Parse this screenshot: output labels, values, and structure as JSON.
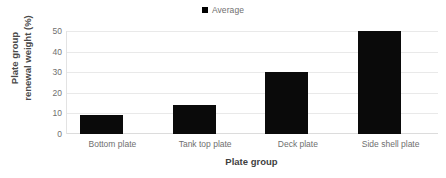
{
  "chart_data": {
    "type": "bar",
    "title": "",
    "subtitle": "",
    "categories": [
      "Bottom plate",
      "Tank top plate",
      "Deck plate",
      "Side shell plate"
    ],
    "values": [
      9,
      14,
      30,
      50
    ],
    "series": [
      {
        "name": "Average",
        "values": [
          9,
          14,
          30,
          50
        ]
      }
    ],
    "xlabel": "Plate group",
    "ylabel": "Plate group renewal weight (%)",
    "ylabel_lines": [
      "Plate group",
      "renewal weight (%)"
    ],
    "ylim": [
      0,
      50
    ],
    "ytick_labels": [
      "0",
      "10",
      "20",
      "30",
      "40",
      "50"
    ],
    "ytick_values": [
      0,
      10,
      20,
      30,
      40,
      50
    ],
    "grid": "horizontal",
    "legend_position": "top-center",
    "legend_entries": [
      "Average"
    ],
    "colors": {
      "bar": "#0a0a0a",
      "gridline": "#e9e9e9",
      "axis_line": "#dcdcdc",
      "tick_text": "#6f6f6f",
      "axis_title_text": "#3f3f3f",
      "background": "#ffffff"
    }
  },
  "legend": {
    "marker_name": "legend-square-marker",
    "label": "Average"
  }
}
